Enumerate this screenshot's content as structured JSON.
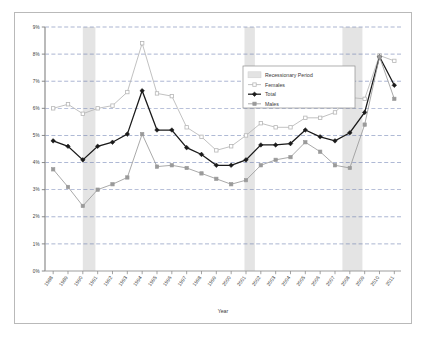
{
  "chart_data": {
    "type": "line",
    "title": "",
    "xlabel": "Year",
    "ylabel": "",
    "ylim": [
      0,
      9
    ],
    "ytick_labels": [
      "0%",
      "1%",
      "2%",
      "3%",
      "4%",
      "5%",
      "6%",
      "7%",
      "8%",
      "9%"
    ],
    "ytick_values": [
      0,
      1,
      2,
      3,
      4,
      5,
      6,
      7,
      8,
      9
    ],
    "grid": true,
    "legend_position": "upper-right",
    "categories": [
      "1988",
      "1989",
      "1990",
      "1991",
      "1992",
      "1993",
      "1994",
      "1995",
      "1996",
      "1997",
      "1998",
      "1999",
      "2000",
      "2001",
      "2002",
      "2003",
      "2004",
      "2005",
      "2006",
      "2007",
      "2008",
      "2009",
      "2010",
      "2011"
    ],
    "series": [
      {
        "name": "Females",
        "color": "#b6b6b6",
        "marker": "open-square",
        "values": [
          6.0,
          6.15,
          5.8,
          6.0,
          6.1,
          6.6,
          8.4,
          6.55,
          6.45,
          5.3,
          4.95,
          4.45,
          4.6,
          5.0,
          5.45,
          5.3,
          5.3,
          5.65,
          5.65,
          5.85,
          6.4,
          6.35,
          7.95,
          7.75
        ]
      },
      {
        "name": "Total",
        "color": "#1a1a1a",
        "marker": "filled-diamond",
        "values": [
          4.8,
          4.6,
          4.1,
          4.6,
          4.75,
          5.05,
          6.65,
          5.2,
          5.2,
          4.55,
          4.3,
          3.9,
          3.9,
          4.1,
          4.65,
          4.65,
          4.7,
          5.2,
          4.95,
          4.8,
          5.1,
          5.85,
          7.9,
          6.85
        ]
      },
      {
        "name": "Males",
        "color": "#9a9a9a",
        "marker": "filled-square",
        "values": [
          3.75,
          3.1,
          2.4,
          3.0,
          3.2,
          3.45,
          5.05,
          3.85,
          3.9,
          3.8,
          3.6,
          3.4,
          3.2,
          3.35,
          3.9,
          4.1,
          4.2,
          4.75,
          4.4,
          3.9,
          3.8,
          5.4,
          7.9,
          6.35
        ]
      }
    ],
    "recession_bands": [
      {
        "start": 1990,
        "end": 1990.85,
        "label": "Recessionary Period"
      },
      {
        "start": 2000.9,
        "end": 2001.6,
        "label": "Recessionary Period"
      },
      {
        "start": 2007.5,
        "end": 2008.85,
        "label": "Recessionary Period"
      }
    ],
    "recession_color": "#e3e3e3"
  },
  "legend": {
    "items": [
      {
        "label": "Recessionary Period",
        "type": "band"
      },
      {
        "label": "Females",
        "type": "line-open-square"
      },
      {
        "label": "Total",
        "type": "line-filled-diamond"
      },
      {
        "label": "Males",
        "type": "line-filled-square"
      }
    ]
  },
  "axis": {
    "x_title": "Year"
  }
}
